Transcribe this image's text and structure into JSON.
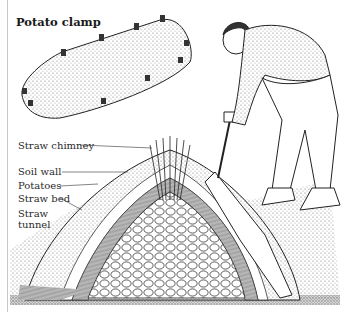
{
  "figure": {
    "title": "Potato clamp",
    "labels": [
      {
        "id": "straw-chimney",
        "text": "Straw chimney"
      },
      {
        "id": "soil-wall",
        "text": "Soil wall"
      },
      {
        "id": "potatoes",
        "text": "Potatoes"
      },
      {
        "id": "straw-bed",
        "text": "Straw bed"
      },
      {
        "id": "straw-tunnel-1",
        "text": "Straw"
      },
      {
        "id": "straw-tunnel-2",
        "text": "tunnel"
      }
    ],
    "colors": {
      "ink": "#1a1a1a",
      "paper": "#ffffff",
      "stipple": "#8a8a8a"
    }
  }
}
